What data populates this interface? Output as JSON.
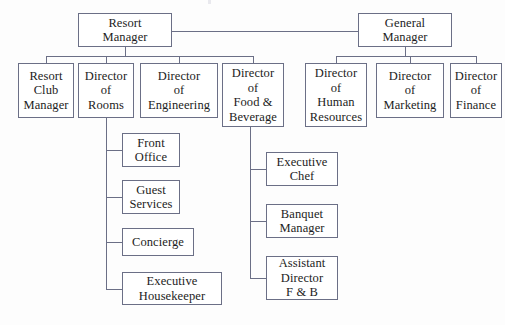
{
  "chart_data": {
    "type": "diagram",
    "diagram_kind": "organizational-chart",
    "orientation": "top-down",
    "nodes": [
      {
        "id": "resort-manager",
        "label": "Resort Manager",
        "lines": [
          "Resort",
          "Manager"
        ],
        "level": 0,
        "x": 78,
        "y": 13,
        "w": 94,
        "h": 34
      },
      {
        "id": "general-manager",
        "label": "General Manager",
        "lines": [
          "General",
          "Manager"
        ],
        "level": 0,
        "x": 358,
        "y": 13,
        "w": 94,
        "h": 34
      },
      {
        "id": "resort-club-manager",
        "label": "Resort Club Manager",
        "lines": [
          "Resort",
          "Club",
          "Manager"
        ],
        "level": 1,
        "x": 18,
        "y": 63,
        "w": 56,
        "h": 55
      },
      {
        "id": "director-of-rooms",
        "label": "Director of Rooms",
        "lines": [
          "Director",
          "of",
          "Rooms"
        ],
        "level": 1,
        "x": 78,
        "y": 63,
        "w": 56,
        "h": 55
      },
      {
        "id": "director-of-engineering",
        "label": "Director of Engineering",
        "lines": [
          "Director",
          "of",
          "Engineering"
        ],
        "level": 1,
        "x": 140,
        "y": 63,
        "w": 78,
        "h": 55
      },
      {
        "id": "director-of-food-beverage",
        "label": "Director of Food & Beverage",
        "lines": [
          "Director",
          "of",
          "Food &",
          "Beverage"
        ],
        "level": 1,
        "x": 222,
        "y": 63,
        "w": 62,
        "h": 64
      },
      {
        "id": "director-of-human-resources",
        "label": "Director of Human Resources",
        "lines": [
          "Director",
          "of",
          "Human",
          "Resources"
        ],
        "level": 1,
        "x": 305,
        "y": 63,
        "w": 62,
        "h": 64
      },
      {
        "id": "director-of-marketing",
        "label": "Director of Marketing",
        "lines": [
          "Director",
          "of",
          "Marketing"
        ],
        "level": 1,
        "x": 376,
        "y": 63,
        "w": 68,
        "h": 55
      },
      {
        "id": "director-of-finance",
        "label": "Director of Finance",
        "lines": [
          "Director",
          "of",
          "Finance"
        ],
        "level": 1,
        "x": 450,
        "y": 63,
        "w": 52,
        "h": 55
      },
      {
        "id": "front-office",
        "label": "Front Office",
        "lines": [
          "Front",
          "Office"
        ],
        "level": 2,
        "x": 122,
        "y": 133,
        "w": 58,
        "h": 34
      },
      {
        "id": "guest-services",
        "label": "Guest Services",
        "lines": [
          "Guest",
          "Services"
        ],
        "level": 2,
        "x": 122,
        "y": 180,
        "w": 58,
        "h": 34
      },
      {
        "id": "concierge",
        "label": "Concierge",
        "lines": [
          "Concierge"
        ],
        "level": 2,
        "x": 122,
        "y": 228,
        "w": 72,
        "h": 28
      },
      {
        "id": "executive-housekeeper",
        "label": "Executive Housekeeper",
        "lines": [
          "Executive",
          "Housekeeper"
        ],
        "level": 2,
        "x": 122,
        "y": 272,
        "w": 100,
        "h": 33
      },
      {
        "id": "executive-chef",
        "label": "Executive Chef",
        "lines": [
          "Executive",
          "Chef"
        ],
        "level": 2,
        "x": 266,
        "y": 152,
        "w": 72,
        "h": 34
      },
      {
        "id": "banquet-manager",
        "label": "Banquet Manager",
        "lines": [
          "Banquet",
          "Manager"
        ],
        "level": 2,
        "x": 266,
        "y": 204,
        "w": 72,
        "h": 34
      },
      {
        "id": "assistant-director-fb",
        "label": "Assistant Director F & B",
        "lines": [
          "Assistant",
          "Director",
          "F & B"
        ],
        "level": 2,
        "x": 266,
        "y": 256,
        "w": 72,
        "h": 44
      }
    ],
    "edges": [
      {
        "from": "resort-manager",
        "to": "general-manager"
      },
      {
        "from": "resort-manager",
        "to": "resort-club-manager"
      },
      {
        "from": "resort-manager",
        "to": "director-of-rooms"
      },
      {
        "from": "resort-manager",
        "to": "director-of-engineering"
      },
      {
        "from": "resort-manager",
        "to": "director-of-food-beverage"
      },
      {
        "from": "general-manager",
        "to": "director-of-human-resources"
      },
      {
        "from": "general-manager",
        "to": "director-of-marketing"
      },
      {
        "from": "general-manager",
        "to": "director-of-finance"
      },
      {
        "from": "director-of-rooms",
        "to": "front-office"
      },
      {
        "from": "director-of-rooms",
        "to": "guest-services"
      },
      {
        "from": "director-of-rooms",
        "to": "concierge"
      },
      {
        "from": "director-of-rooms",
        "to": "executive-housekeeper"
      },
      {
        "from": "director-of-food-beverage",
        "to": "executive-chef"
      },
      {
        "from": "director-of-food-beverage",
        "to": "banquet-manager"
      },
      {
        "from": "director-of-food-beverage",
        "to": "assistant-director-fb"
      }
    ],
    "colors": {
      "background": "#fdfdfd",
      "node_fill": "#ffffff",
      "border": "#6b6f86",
      "text": "#1c1c22"
    }
  },
  "connectors": {
    "peer_link": {
      "x": 172,
      "y": 31,
      "w": 186,
      "h": 1,
      "dir": "h"
    },
    "left_trunk_v": {
      "x": 125,
      "y": 47,
      "w": 1,
      "h": 9,
      "dir": "v"
    },
    "left_bus_h": {
      "x": 46,
      "y": 56,
      "w": 207,
      "h": 1,
      "dir": "h"
    },
    "left_drop_1": {
      "x": 46,
      "y": 56,
      "w": 1,
      "h": 7,
      "dir": "v"
    },
    "left_drop_2": {
      "x": 106,
      "y": 56,
      "w": 1,
      "h": 7,
      "dir": "v"
    },
    "left_drop_3": {
      "x": 179,
      "y": 56,
      "w": 1,
      "h": 7,
      "dir": "v"
    },
    "left_drop_4": {
      "x": 253,
      "y": 56,
      "w": 1,
      "h": 7,
      "dir": "v"
    },
    "right_trunk_v": {
      "x": 405,
      "y": 47,
      "w": 1,
      "h": 9,
      "dir": "v"
    },
    "right_bus_h": {
      "x": 336,
      "y": 56,
      "w": 140,
      "h": 1,
      "dir": "h"
    },
    "right_drop_1": {
      "x": 336,
      "y": 56,
      "w": 1,
      "h": 7,
      "dir": "v"
    },
    "right_drop_2": {
      "x": 410,
      "y": 56,
      "w": 1,
      "h": 7,
      "dir": "v"
    },
    "right_drop_3": {
      "x": 476,
      "y": 56,
      "w": 1,
      "h": 7,
      "dir": "v"
    },
    "rooms_spine": {
      "x": 106,
      "y": 118,
      "w": 1,
      "h": 172,
      "dir": "v"
    },
    "rooms_arm_1": {
      "x": 106,
      "y": 150,
      "w": 16,
      "h": 1,
      "dir": "h"
    },
    "rooms_arm_2": {
      "x": 106,
      "y": 197,
      "w": 16,
      "h": 1,
      "dir": "h"
    },
    "rooms_arm_3": {
      "x": 106,
      "y": 242,
      "w": 16,
      "h": 1,
      "dir": "h"
    },
    "rooms_arm_4": {
      "x": 106,
      "y": 289,
      "w": 16,
      "h": 1,
      "dir": "h"
    },
    "fb_spine": {
      "x": 250,
      "y": 127,
      "w": 1,
      "h": 151,
      "dir": "v"
    },
    "fb_arm_1": {
      "x": 250,
      "y": 169,
      "w": 16,
      "h": 1,
      "dir": "h"
    },
    "fb_arm_2": {
      "x": 250,
      "y": 221,
      "w": 16,
      "h": 1,
      "dir": "h"
    },
    "fb_arm_3": {
      "x": 250,
      "y": 278,
      "w": 16,
      "h": 1,
      "dir": "h"
    }
  }
}
